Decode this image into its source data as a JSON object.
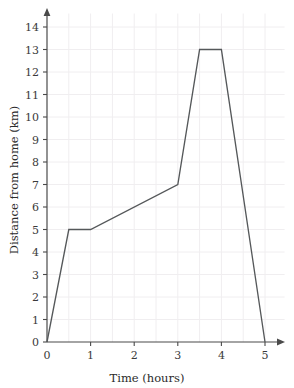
{
  "chart_data": {
    "type": "line",
    "title": "",
    "xlabel": "Time (hours)",
    "ylabel": "Distance from home (km)",
    "xlim": [
      0,
      5
    ],
    "ylim": [
      0,
      14
    ],
    "grid": true,
    "legend": "none",
    "x_ticks": [
      "0",
      "1",
      "2",
      "3",
      "4",
      "5"
    ],
    "x_tick_values": [
      0,
      1,
      2,
      3,
      4,
      5
    ],
    "y_ticks": [
      "0",
      "1",
      "2",
      "3",
      "4",
      "5",
      "6",
      "7",
      "8",
      "9",
      "10",
      "11",
      "12",
      "13",
      "14"
    ],
    "y_tick_values": [
      0,
      1,
      2,
      3,
      4,
      5,
      6,
      7,
      8,
      9,
      10,
      11,
      12,
      13,
      14
    ],
    "x_minor_step": 0.5,
    "y_minor_step": 1,
    "series": [
      {
        "name": "journey",
        "color": "#55585a",
        "points": [
          {
            "x": 0,
            "y": 0
          },
          {
            "x": 0.5,
            "y": 5
          },
          {
            "x": 1,
            "y": 5
          },
          {
            "x": 3,
            "y": 7
          },
          {
            "x": 3.5,
            "y": 13
          },
          {
            "x": 4,
            "y": 13
          },
          {
            "x": 5,
            "y": 0
          }
        ]
      }
    ]
  },
  "style": {
    "line_color": "#55585a",
    "axis_color": "#4a4a4a",
    "grid_color": "#f0eef0",
    "background": "#ffffff",
    "text_color": "#2b2b2b"
  }
}
